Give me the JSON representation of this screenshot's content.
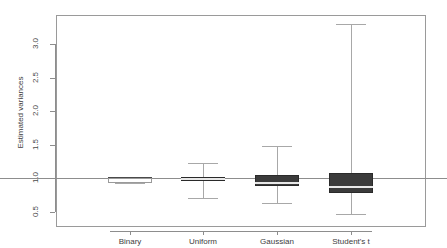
{
  "chart_data": {
    "type": "box",
    "title": "",
    "xlabel": "",
    "ylabel": "Estimated variances",
    "categories": [
      "Binary",
      "Uniform",
      "Gaussian",
      "Student's t"
    ],
    "ylim": [
      0.4,
      3.45
    ],
    "yticks": [
      "0.5",
      "1.0",
      "1.5",
      "2.0",
      "2.5",
      "3.0"
    ],
    "ytick_values": [
      0.5,
      1.0,
      1.5,
      2.0,
      2.5,
      3.0
    ],
    "grid": false,
    "legend": "none",
    "reference_line": 1.0,
    "boxes": [
      {
        "name": "Binary",
        "whisker_low": 0.93,
        "q1": 0.93,
        "median": 1.0,
        "q3": 1.0,
        "whisker_high": 1.0,
        "style": "hollow"
      },
      {
        "name": "Uniform",
        "whisker_low": 0.7,
        "q1": 0.95,
        "median": 0.99,
        "q3": 1.02,
        "whisker_high": 1.23,
        "style": "filled"
      },
      {
        "name": "Gaussian",
        "whisker_low": 0.62,
        "q1": 0.88,
        "median": 0.93,
        "q3": 1.05,
        "whisker_high": 1.48,
        "style": "filled"
      },
      {
        "name": "Student's t",
        "whisker_low": 0.47,
        "q1": 0.77,
        "median": 0.87,
        "q3": 1.08,
        "whisker_high": 3.3,
        "style": "filled"
      }
    ]
  },
  "axis": {
    "y_title": "Estimated variances",
    "y_labels": [
      "0.5",
      "1.0",
      "1.5",
      "2.0",
      "2.5",
      "3.0"
    ],
    "x_labels": [
      "Binary",
      "Uniform",
      "Gaussian",
      "Student's t"
    ]
  },
  "colors": {
    "box_fill": "#3b3b3b",
    "box_stroke": "#2a2a2a",
    "whisker": "#a8a8a8",
    "median_light": "#e8e8e8",
    "frame": "#9a9a9a",
    "text": "#3d3d3d",
    "background": "#ffffff"
  }
}
